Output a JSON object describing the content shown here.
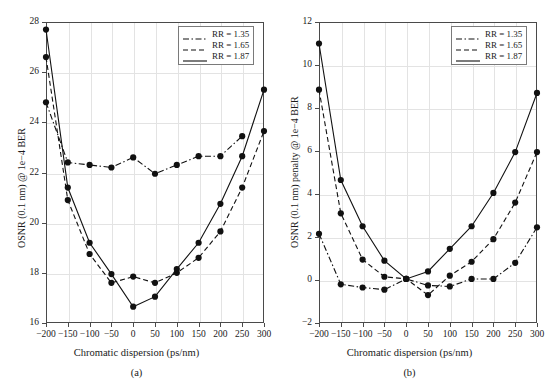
{
  "figure": {
    "panels": [
      {
        "id": "a",
        "caption": "(a)",
        "xlabel": "Chromatic dispersion (ps/nm)",
        "ylabel": "OSNR (0.1 nm) @ 1e−4 BER",
        "legend": [
          {
            "label": "RR = 1.35",
            "style": "dashdot"
          },
          {
            "label": "RR = 1.65",
            "style": "dashed"
          },
          {
            "label": "RR = 1.87",
            "style": "solid"
          }
        ]
      },
      {
        "id": "b",
        "caption": "(b)",
        "xlabel": "Chromatic dispersion (ps/nm)",
        "ylabel": "OSNR (0.1 nm) penalty @ 1e−4 BER",
        "legend": [
          {
            "label": "RR = 1.35",
            "style": "dashdot"
          },
          {
            "label": "RR = 1.65",
            "style": "dashed"
          },
          {
            "label": "RR = 1.87",
            "style": "solid"
          }
        ]
      }
    ]
  },
  "chart_data": [
    {
      "type": "line",
      "panel": "a",
      "title": "",
      "xlabel": "Chromatic dispersion (ps/nm)",
      "ylabel": "OSNR (0.1 nm) @ 1e−4 BER",
      "xlim": [
        -200,
        300
      ],
      "ylim": [
        16,
        28
      ],
      "xticks": [
        -200,
        -150,
        -100,
        -50,
        0,
        50,
        100,
        150,
        200,
        250,
        300
      ],
      "xticklabels": [
        "−200",
        "−150",
        "−100",
        "−50",
        "0",
        "50",
        "100",
        "150",
        "200",
        "250",
        "300"
      ],
      "yticks": [
        16,
        18,
        20,
        22,
        24,
        26,
        28
      ],
      "yticklabels": [
        "16",
        "18",
        "20",
        "22",
        "24",
        "26",
        "28"
      ],
      "grid": true,
      "legend_position": "upper right",
      "x": [
        -200,
        -150,
        -100,
        -50,
        0,
        50,
        100,
        150,
        200,
        250,
        300
      ],
      "series": [
        {
          "name": "RR = 1.35",
          "style": "dashdot",
          "marker": "filled-circle",
          "values": [
            24.8,
            22.4,
            22.3,
            22.2,
            22.6,
            21.95,
            22.3,
            22.65,
            22.65,
            23.45,
            null
          ]
        },
        {
          "name": "RR = 1.65",
          "style": "dashed",
          "marker": "filled-circle",
          "values": [
            26.6,
            20.9,
            18.75,
            17.6,
            17.85,
            17.6,
            18.0,
            18.6,
            19.65,
            21.4,
            23.65
          ]
        },
        {
          "name": "RR = 1.87",
          "style": "solid",
          "marker": "filled-circle",
          "values": [
            27.7,
            21.4,
            19.2,
            17.95,
            16.65,
            17.05,
            18.15,
            19.2,
            20.75,
            22.65,
            25.3
          ]
        }
      ]
    },
    {
      "type": "line",
      "panel": "b",
      "title": "",
      "xlabel": "Chromatic dispersion (ps/nm)",
      "ylabel": "OSNR (0.1 nm) penalty @ 1e−4 BER",
      "xlim": [
        -200,
        300
      ],
      "ylim": [
        -2,
        12
      ],
      "xticks": [
        -200,
        -150,
        -100,
        -50,
        0,
        50,
        100,
        150,
        200,
        250,
        300
      ],
      "xticklabels": [
        "−200",
        "−150",
        "−100",
        "−50",
        "0",
        "50",
        "100",
        "150",
        "200",
        "250",
        "300"
      ],
      "yticks": [
        -2,
        0,
        2,
        4,
        6,
        8,
        10,
        12
      ],
      "yticklabels": [
        "−2",
        "0",
        "2",
        "4",
        "6",
        "8",
        "10",
        "12"
      ],
      "grid": true,
      "legend_position": "upper right",
      "x": [
        -200,
        -150,
        -100,
        -50,
        0,
        50,
        100,
        150,
        200,
        250,
        300
      ],
      "series": [
        {
          "name": "RR = 1.35",
          "style": "dashdot",
          "marker": "filled-circle",
          "values": [
            2.15,
            -0.2,
            -0.35,
            -0.45,
            0.05,
            -0.25,
            -0.3,
            0.05,
            0.05,
            0.8,
            2.45
          ]
        },
        {
          "name": "RR = 1.65",
          "style": "dashed",
          "marker": "filled-circle",
          "values": [
            8.85,
            3.1,
            0.95,
            0.15,
            0.05,
            -0.7,
            0.2,
            0.85,
            1.9,
            3.6,
            5.95
          ]
        },
        {
          "name": "RR = 1.87",
          "style": "solid",
          "marker": "filled-circle",
          "values": [
            11.0,
            4.65,
            2.5,
            0.9,
            0.05,
            0.4,
            1.45,
            2.5,
            4.05,
            5.95,
            8.7
          ]
        }
      ]
    }
  ]
}
